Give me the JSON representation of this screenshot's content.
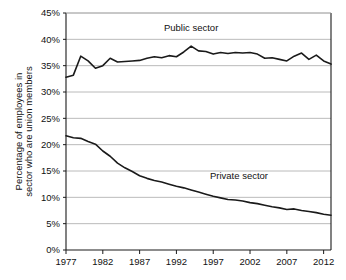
{
  "chart_data": {
    "type": "line",
    "title": "",
    "xlabel": "",
    "ylabel": "Percentage of employees in sector who are union members",
    "ylabel_line1": "Percentage of employees in",
    "ylabel_line2": "sector who are union members",
    "xlim": [
      1977,
      2013
    ],
    "ylim": [
      0,
      45
    ],
    "y_tick_values": [
      0,
      5,
      10,
      15,
      20,
      25,
      30,
      35,
      40,
      45
    ],
    "y_tick_labels": [
      "0%",
      "5%",
      "10%",
      "15%",
      "20%",
      "25%",
      "30%",
      "35%",
      "40%",
      "45%"
    ],
    "x_tick_values": [
      1977,
      1982,
      1987,
      1992,
      1997,
      2002,
      2007,
      2012
    ],
    "x_tick_labels": [
      "1977",
      "1982",
      "1987",
      "1992",
      "1997",
      "2002",
      "2007",
      "2012"
    ],
    "grid": true,
    "grid_axis": "y",
    "legend_position": "inline-annotation",
    "line_color": "#1a1a1a",
    "grid_color": "#a8a8a8",
    "axis_color": "#1a1a1a",
    "background_color": "#ffffff",
    "x": [
      1977,
      1978,
      1979,
      1980,
      1981,
      1982,
      1983,
      1984,
      1985,
      1986,
      1987,
      1988,
      1989,
      1990,
      1991,
      1992,
      1993,
      1994,
      1995,
      1996,
      1997,
      1998,
      1999,
      2000,
      2001,
      2002,
      2003,
      2004,
      2005,
      2006,
      2007,
      2008,
      2009,
      2010,
      2011,
      2012,
      2013
    ],
    "series": [
      {
        "name": "Public sector",
        "label": "Public sector",
        "label_x": 1994,
        "label_y": 41.6,
        "values": [
          32.8,
          33.2,
          36.8,
          35.9,
          34.5,
          35.0,
          36.4,
          35.7,
          35.8,
          35.9,
          36.0,
          36.4,
          36.7,
          36.5,
          36.9,
          36.7,
          37.6,
          38.7,
          37.8,
          37.7,
          37.2,
          37.5,
          37.3,
          37.5,
          37.4,
          37.5,
          37.2,
          36.4,
          36.5,
          36.2,
          35.9,
          36.8,
          37.4,
          36.2,
          37.0,
          35.9,
          35.3
        ]
      },
      {
        "name": "Private sector",
        "label": "Private sector",
        "label_x": 2000.5,
        "label_y": 13.4,
        "values": [
          21.7,
          21.3,
          21.2,
          20.6,
          20.1,
          18.8,
          17.8,
          16.5,
          15.6,
          14.9,
          14.1,
          13.6,
          13.2,
          12.9,
          12.5,
          12.1,
          11.8,
          11.4,
          11.0,
          10.6,
          10.2,
          9.9,
          9.6,
          9.5,
          9.3,
          9.0,
          8.8,
          8.5,
          8.2,
          8.0,
          7.7,
          7.8,
          7.5,
          7.3,
          7.1,
          6.8,
          6.6
        ]
      }
    ]
  },
  "plot_geometry": {
    "left": 66,
    "right": 331,
    "top": 13,
    "bottom": 250
  }
}
